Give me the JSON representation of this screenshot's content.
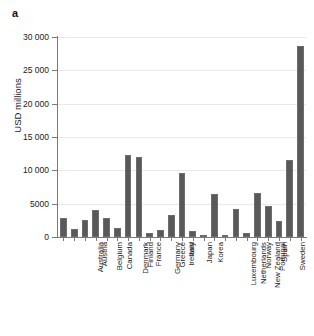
{
  "panel": {
    "letter": "a"
  },
  "chart_data": {
    "type": "bar",
    "title": "",
    "subtitle": "",
    "xlabel": "",
    "ylabel": "USD millions",
    "ylim": [
      0,
      30000
    ],
    "grid": true,
    "legend": "none",
    "y_ticks": [
      "0",
      "5000",
      "10 000",
      "15 000",
      "20 000",
      "25 000",
      "30 000"
    ],
    "y_tick_values": [
      0,
      5000,
      10000,
      15000,
      20000,
      25000,
      30000
    ],
    "categories": [
      "Australia",
      "Austria",
      "Belgium",
      "Canada",
      "Denmark",
      "Finland",
      "France",
      "Germany",
      "Greece",
      "Ireland",
      "Italy",
      "Japan",
      "Korea",
      "Luxembourg",
      "Netherlands",
      "New Zealand",
      "Norway",
      "Portugal",
      "Spain",
      "Sweden",
      "Switzerland",
      "United Kingdom",
      "United States"
    ],
    "values": [
      2800,
      1150,
      2550,
      4050,
      2800,
      1300,
      12300,
      11950,
      620,
      1000,
      3350,
      9550,
      900,
      350,
      6450,
      350,
      4150,
      550,
      6600,
      4600,
      2350,
      11500,
      28700
    ],
    "bar_color": "#595959",
    "axis_color": "#7a7a7a",
    "grid_color": "#e9e9e9"
  }
}
